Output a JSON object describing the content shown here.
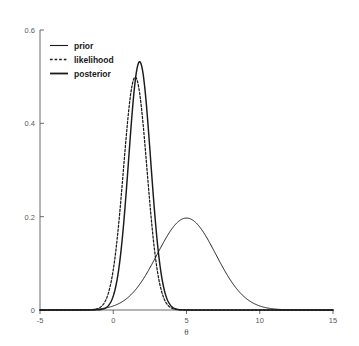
{
  "chart_data": {
    "type": "line",
    "title": "",
    "subtitle": "",
    "xlabel": "θ",
    "ylabel": "",
    "xlim": [
      -5,
      15
    ],
    "ylim": [
      0,
      0.6
    ],
    "xticks": [
      -5,
      0,
      5,
      10,
      15
    ],
    "xtick_labels": [
      "-5",
      "0",
      "5",
      "10",
      "15"
    ],
    "yticks": [
      0,
      0.2,
      0.4,
      0.6
    ],
    "ytick_labels": [
      "0",
      "0.2",
      "0.4",
      "0.6"
    ],
    "grid": false,
    "legend_position": "upper left",
    "background_color": "#ffffff",
    "line_color": "#1a1a1a",
    "axis_color": "#5a5a5a",
    "series": [
      {
        "name": "prior",
        "style": "solid-thin",
        "distribution": "normal",
        "mean": 5.0,
        "sd": 2.0,
        "peak_value": 0.197,
        "peak_x": 5.0,
        "x": [
          -5,
          -4,
          -3,
          -2,
          -1,
          0,
          1,
          2,
          3,
          4,
          5,
          6,
          7,
          8,
          9,
          10,
          11,
          12,
          13,
          14,
          15
        ],
        "values": [
          0.0,
          0.0001,
          0.0004,
          0.0022,
          0.0088,
          0.027,
          0.0648,
          0.121,
          0.176,
          0.1995,
          0.1995,
          0.176,
          0.121,
          0.0648,
          0.027,
          0.0088,
          0.0022,
          0.0004,
          0.0001,
          0.0,
          0.0
        ]
      },
      {
        "name": "likelihood",
        "style": "dashed",
        "distribution": "normal",
        "mean": 1.5,
        "sd": 0.8,
        "peak_value": 0.499,
        "peak_x": 1.5,
        "x": [
          -5,
          -4,
          -3,
          -2,
          -1,
          0,
          0.5,
          1,
          1.5,
          2,
          2.5,
          3,
          3.5,
          4,
          5,
          6,
          7,
          8,
          9,
          10,
          15
        ],
        "values": [
          0.0,
          0.0,
          0.0,
          0.0,
          0.0029,
          0.0648,
          0.1826,
          0.3397,
          0.4987,
          0.3397,
          0.1826,
          0.0648,
          0.0146,
          0.0029,
          0.0,
          0.0,
          0.0,
          0.0,
          0.0,
          0.0,
          0.0
        ]
      },
      {
        "name": "posterior",
        "style": "solid-thick",
        "distribution": "normal",
        "mean": 1.8,
        "sd": 0.75,
        "peak_value": 0.532,
        "peak_x": 1.8,
        "x": [
          -5,
          -4,
          -3,
          -2,
          -1,
          0,
          0.5,
          1,
          1.5,
          1.8,
          2,
          2.5,
          3,
          3.5,
          4,
          4.5,
          5,
          6,
          7,
          8,
          10,
          15
        ],
        "values": [
          0.0,
          0.0,
          0.0,
          0.0,
          0.0008,
          0.0343,
          0.1145,
          0.26,
          0.4296,
          0.5319,
          0.51,
          0.3354,
          0.1564,
          0.051,
          0.0117,
          0.0019,
          0.0002,
          0.0,
          0.0,
          0.0,
          0.0,
          0.0
        ]
      }
    ]
  },
  "legend": {
    "entries": [
      {
        "label": "prior"
      },
      {
        "label": "likelihood"
      },
      {
        "label": "posterior"
      }
    ]
  }
}
